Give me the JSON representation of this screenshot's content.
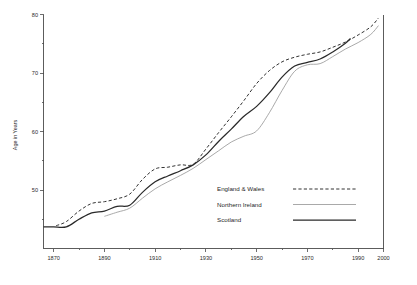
{
  "chart_data": {
    "type": "line",
    "title": "",
    "xlabel": "",
    "ylabel": "Age in Years",
    "xlim": [
      1866,
      2000
    ],
    "ylim": [
      40,
      80
    ],
    "grid": false,
    "legend_position": "center-right-inside",
    "x_ticks_major": [
      1870,
      1890,
      1910,
      1930,
      1950,
      1970,
      1990,
      2000
    ],
    "x_ticks_minor": [
      1880,
      1900,
      1920,
      1940,
      1960,
      1980
    ],
    "x_tick_labels": [
      "1870",
      "1890",
      "1910",
      "1930",
      "1950",
      "1970",
      "1990",
      "2000"
    ],
    "y_ticks_major": [
      50,
      60,
      70,
      80
    ],
    "y_ticks_minor": [
      45,
      55,
      65,
      75
    ],
    "y_tick_labels": [
      "50",
      "60",
      "70",
      "80"
    ],
    "series": [
      {
        "name": "England & Wales",
        "style": "dashed",
        "color": "#333333",
        "points": [
          [
            1871,
            43.9
          ],
          [
            1875,
            44.6
          ],
          [
            1880,
            46.4
          ],
          [
            1885,
            47.7
          ],
          [
            1890,
            48.0
          ],
          [
            1895,
            48.5
          ],
          [
            1900,
            49.3
          ],
          [
            1905,
            51.8
          ],
          [
            1910,
            53.6
          ],
          [
            1915,
            53.9
          ],
          [
            1920,
            54.3
          ],
          [
            1925,
            54.4
          ],
          [
            1930,
            57.0
          ],
          [
            1935,
            59.8
          ],
          [
            1940,
            62.5
          ],
          [
            1945,
            65.3
          ],
          [
            1950,
            68.2
          ],
          [
            1955,
            70.4
          ],
          [
            1960,
            71.9
          ],
          [
            1965,
            72.7
          ],
          [
            1970,
            73.2
          ],
          [
            1975,
            73.6
          ],
          [
            1980,
            74.4
          ],
          [
            1985,
            75.3
          ],
          [
            1990,
            76.5
          ],
          [
            1995,
            77.9
          ],
          [
            1998,
            79.4
          ]
        ]
      },
      {
        "name": "Northern Ireland",
        "style": "thin-solid",
        "color": "#9a9a9a",
        "points": [
          [
            1890,
            45.5
          ],
          [
            1895,
            46.2
          ],
          [
            1900,
            46.9
          ],
          [
            1905,
            48.6
          ],
          [
            1910,
            50.2
          ],
          [
            1915,
            51.4
          ],
          [
            1920,
            52.5
          ],
          [
            1925,
            53.7
          ],
          [
            1930,
            55.2
          ],
          [
            1935,
            56.7
          ],
          [
            1940,
            58.2
          ],
          [
            1945,
            59.2
          ],
          [
            1950,
            60.1
          ],
          [
            1955,
            63.2
          ],
          [
            1960,
            67.0
          ],
          [
            1965,
            70.3
          ],
          [
            1970,
            71.4
          ],
          [
            1975,
            71.6
          ],
          [
            1980,
            72.8
          ],
          [
            1985,
            74.1
          ],
          [
            1990,
            75.2
          ],
          [
            1995,
            76.6
          ],
          [
            1998,
            78.1
          ]
        ]
      },
      {
        "name": "Scotland",
        "style": "solid",
        "color": "#2a2a2a",
        "points": [
          [
            1866,
            43.7
          ],
          [
            1870,
            43.7
          ],
          [
            1875,
            43.7
          ],
          [
            1880,
            45.0
          ],
          [
            1885,
            46.1
          ],
          [
            1890,
            46.4
          ],
          [
            1895,
            47.2
          ],
          [
            1900,
            47.4
          ],
          [
            1905,
            49.6
          ],
          [
            1910,
            51.4
          ],
          [
            1915,
            52.4
          ],
          [
            1920,
            53.3
          ],
          [
            1925,
            54.3
          ],
          [
            1930,
            56.0
          ],
          [
            1935,
            58.3
          ],
          [
            1940,
            60.4
          ],
          [
            1945,
            62.6
          ],
          [
            1950,
            64.3
          ],
          [
            1955,
            66.6
          ],
          [
            1960,
            69.3
          ],
          [
            1965,
            71.2
          ],
          [
            1970,
            71.8
          ],
          [
            1975,
            72.4
          ],
          [
            1980,
            73.6
          ],
          [
            1985,
            75.1
          ],
          [
            1987,
            75.9
          ]
        ]
      }
    ]
  },
  "legend": {
    "items": [
      {
        "label": "England & Wales",
        "style": "dashed"
      },
      {
        "label": "Northern Ireland",
        "style": "thin-solid"
      },
      {
        "label": "Scotland",
        "style": "solid"
      }
    ]
  }
}
